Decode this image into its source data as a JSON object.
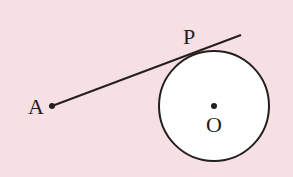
{
  "diagram": {
    "background": "#f7e0e3",
    "stroke_color": "#231f20",
    "circle_fill": "#ffffff",
    "circle": {
      "cx": 214,
      "cy": 106,
      "r": 55
    },
    "points": {
      "A": {
        "label": "A",
        "x": 52,
        "y": 106
      },
      "O": {
        "label": "O",
        "x": 214,
        "y": 106
      },
      "P": {
        "label": "P"
      }
    },
    "tangent_line": {
      "x1": 52,
      "y1": 106,
      "x2": 241,
      "y2": 35
    }
  }
}
